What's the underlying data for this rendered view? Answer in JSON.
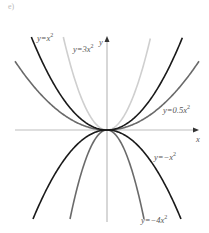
{
  "chart_data": {
    "type": "line",
    "title": "",
    "xlabel": "x",
    "ylabel": "y",
    "grid": false,
    "legend": "inline labels",
    "x": [
      -2,
      -1.5,
      -1,
      -0.5,
      0,
      0.5,
      1,
      1.5,
      2
    ],
    "series": [
      {
        "name": "y=x^2",
        "label": "y = x²",
        "coef": 1,
        "color": "#1a1a1a",
        "values": [
          4,
          2.25,
          1,
          0.25,
          0,
          0.25,
          1,
          2.25,
          4
        ]
      },
      {
        "name": "y=3x^2",
        "label": "y = 3x²",
        "coef": 3,
        "color": "#cfcfcf",
        "values": [
          12,
          6.75,
          3,
          0.75,
          0,
          0.75,
          3,
          6.75,
          12
        ]
      },
      {
        "name": "y=0.5x^2",
        "label": "y = 0.5x²",
        "coef": 0.5,
        "color": "#6a6a6a",
        "values": [
          2,
          1.125,
          0.5,
          0.125,
          0,
          0.125,
          0.5,
          1.125,
          2
        ]
      },
      {
        "name": "y=-x^2",
        "label": "y = −x²",
        "coef": -1,
        "color": "#1a1a1a",
        "values": [
          -4,
          -2.25,
          -1,
          -0.25,
          0,
          -0.25,
          -1,
          -2.25,
          -4
        ]
      },
      {
        "name": "y=-4x^2",
        "label": "y = −4x²",
        "coef": -4,
        "color": "#6a6a6a",
        "values": [
          -16,
          -9,
          -4,
          -1,
          0,
          -1,
          -4,
          -9,
          -16
        ]
      }
    ],
    "axis_color": "#bdbdbd"
  },
  "labels": {
    "corner": "e)",
    "x_axis": "x",
    "y_axis": "y",
    "x2": {
      "pre": "y=x",
      "exp": "2"
    },
    "x3": {
      "pre": "y=3x",
      "exp": "2"
    },
    "x05": {
      "pre": "y=0.5x",
      "exp": "2"
    },
    "nx2": {
      "pre": "y=−x",
      "exp": "2"
    },
    "n4x2": {
      "pre": "y=−4x",
      "exp": "2"
    }
  }
}
